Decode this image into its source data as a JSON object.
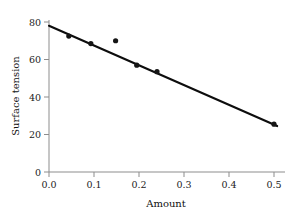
{
  "chart_data": {
    "type": "scatter",
    "title": "",
    "xlabel": "Amount",
    "ylabel": "Surface tension",
    "xlim": [
      0.0,
      0.52
    ],
    "ylim": [
      0,
      84
    ],
    "grid": false,
    "legend": "none",
    "xticks": [
      0.0,
      0.1,
      0.2,
      0.3,
      0.4,
      0.5
    ],
    "xtick_labels": [
      "0.0",
      "0.1",
      "0.2",
      "0.3",
      "0.4",
      "0.5"
    ],
    "yticks": [
      0,
      20,
      40,
      60,
      80
    ],
    "ytick_labels": [
      "0",
      "20",
      "40",
      "60",
      "80"
    ],
    "points": [
      {
        "x": 0.044,
        "y": 72.5
      },
      {
        "x": 0.093,
        "y": 68.5
      },
      {
        "x": 0.148,
        "y": 70.0
      },
      {
        "x": 0.195,
        "y": 57.0
      },
      {
        "x": 0.24,
        "y": 53.5
      },
      {
        "x": 0.5,
        "y": 25.5
      }
    ],
    "series": [
      {
        "name": "observations",
        "x": [
          0.044,
          0.093,
          0.148,
          0.195,
          0.24,
          0.5
        ],
        "values": [
          72.5,
          68.5,
          70.0,
          57.0,
          53.5,
          25.5
        ]
      },
      {
        "name": "fitted-line",
        "type": "line",
        "x": [
          0.0,
          0.507
        ],
        "values": [
          78.0,
          24.5
        ]
      }
    ],
    "fit_line": {
      "x_start": 0.0,
      "y_start": 78.0,
      "x_end": 0.507,
      "y_end": 24.5,
      "color": "#0d0d0d"
    },
    "marker_color": "#151515",
    "axis_color": "#8d8d8d"
  }
}
